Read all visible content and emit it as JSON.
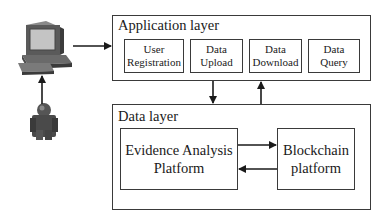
{
  "diagram": {
    "actors": {
      "computer": {
        "icon": "desktop-computer-icon"
      },
      "user": {
        "icon": "user-person-icon"
      }
    },
    "application_layer": {
      "title": "Application layer",
      "modules": [
        {
          "line1": "User",
          "line2": "Registration"
        },
        {
          "line1": "Data",
          "line2": "Upload"
        },
        {
          "line1": "Data",
          "line2": "Download"
        },
        {
          "line1": "Data",
          "line2": "Query"
        }
      ]
    },
    "data_layer": {
      "title": "Data layer",
      "evidence_platform": {
        "line1": "Evidence Analysis",
        "line2": "Platform"
      },
      "blockchain_platform": {
        "line1": "Blockchain",
        "line2": "platform"
      }
    },
    "connections": [
      {
        "from": "user",
        "to": "computer",
        "direction": "up"
      },
      {
        "from": "computer",
        "to": "application_layer",
        "direction": "right"
      },
      {
        "from": "application_layer",
        "to": "data_layer",
        "direction": "down"
      },
      {
        "from": "data_layer",
        "to": "application_layer",
        "direction": "up"
      },
      {
        "from": "evidence_platform",
        "to": "blockchain_platform",
        "direction": "right"
      },
      {
        "from": "blockchain_platform",
        "to": "evidence_platform",
        "direction": "left"
      }
    ],
    "colors": {
      "line": "#1a1a1a",
      "border": "#3a3a3a",
      "icon_dark": "#4a4a4a",
      "icon_light": "#9a9a9a"
    }
  }
}
